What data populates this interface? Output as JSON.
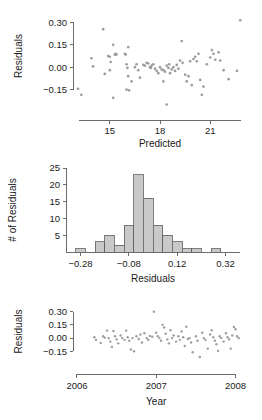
{
  "figure": {
    "title": "",
    "background": "#ffffff",
    "point_color": "#9d9d9d",
    "bar_fill": "#c9c9c9",
    "bar_stroke": "#5f5f5f",
    "axis_color": "#6b6b6b"
  },
  "chart_data": [
    {
      "type": "scatter",
      "panel": "residuals-vs-predicted",
      "title": "",
      "xlabel": "Predicted",
      "ylabel": "Residuals",
      "xlim": [
        12.8,
        23.2
      ],
      "ylim": [
        -0.24,
        0.33
      ],
      "xticks": [
        15,
        18,
        21
      ],
      "xticklabels": [
        "15",
        "18",
        "21"
      ],
      "yticks": [
        -0.15,
        0.0,
        0.15,
        0.3
      ],
      "yticklabels": [
        "-0.15",
        "0.00",
        "0.15",
        "0.30"
      ],
      "grid": false,
      "legend": null,
      "points": [
        {
          "x": 13.1,
          "y": -0.145
        },
        {
          "x": 13.3,
          "y": -0.185
        },
        {
          "x": 13.9,
          "y": 0.06
        },
        {
          "x": 14.0,
          "y": 0.005
        },
        {
          "x": 14.6,
          "y": 0.255
        },
        {
          "x": 14.7,
          "y": -0.045
        },
        {
          "x": 14.9,
          "y": 0.075
        },
        {
          "x": 15.0,
          "y": 0.07
        },
        {
          "x": 15.05,
          "y": 0.035
        },
        {
          "x": 15.2,
          "y": 0.15
        },
        {
          "x": 15.3,
          "y": 0.085
        },
        {
          "x": 15.35,
          "y": 0.09
        },
        {
          "x": 15.4,
          "y": 0.085
        },
        {
          "x": 15.2,
          "y": -0.205
        },
        {
          "x": 15.0,
          "y": -0.02
        },
        {
          "x": 15.9,
          "y": 0.09
        },
        {
          "x": 15.95,
          "y": 0.085
        },
        {
          "x": 16.1,
          "y": 0.135
        },
        {
          "x": 16.0,
          "y": 0.02
        },
        {
          "x": 16.05,
          "y": -0.005
        },
        {
          "x": 16.1,
          "y": -0.06
        },
        {
          "x": 16.0,
          "y": -0.15
        },
        {
          "x": 16.15,
          "y": -0.155
        },
        {
          "x": 16.3,
          "y": -0.095
        },
        {
          "x": 16.5,
          "y": 0.0
        },
        {
          "x": 16.6,
          "y": 0.02
        },
        {
          "x": 16.7,
          "y": -0.02
        },
        {
          "x": 16.8,
          "y": -0.07
        },
        {
          "x": 17.0,
          "y": 0.015
        },
        {
          "x": 17.1,
          "y": 0.01
        },
        {
          "x": 17.2,
          "y": 0.03
        },
        {
          "x": 17.3,
          "y": 0.025
        },
        {
          "x": 17.4,
          "y": 0.0
        },
        {
          "x": 17.45,
          "y": -0.005
        },
        {
          "x": 17.5,
          "y": 0.01
        },
        {
          "x": 17.6,
          "y": 0.02
        },
        {
          "x": 17.7,
          "y": -0.01
        },
        {
          "x": 17.8,
          "y": -0.025
        },
        {
          "x": 17.9,
          "y": -0.04
        },
        {
          "x": 18.0,
          "y": 0.0
        },
        {
          "x": 18.1,
          "y": -0.015
        },
        {
          "x": 18.2,
          "y": -0.02
        },
        {
          "x": 18.3,
          "y": -0.03
        },
        {
          "x": 18.4,
          "y": 0.01
        },
        {
          "x": 18.5,
          "y": -0.005
        },
        {
          "x": 18.55,
          "y": 0.02
        },
        {
          "x": 18.6,
          "y": -0.04
        },
        {
          "x": 18.7,
          "y": -0.015
        },
        {
          "x": 18.8,
          "y": 0.0
        },
        {
          "x": 18.9,
          "y": -0.025
        },
        {
          "x": 18.2,
          "y": -0.095
        },
        {
          "x": 18.4,
          "y": -0.25
        },
        {
          "x": 19.0,
          "y": 0.015
        },
        {
          "x": 19.1,
          "y": -0.01
        },
        {
          "x": 19.2,
          "y": 0.045
        },
        {
          "x": 19.3,
          "y": 0.175
        },
        {
          "x": 19.35,
          "y": 0.03
        },
        {
          "x": 19.5,
          "y": -0.05
        },
        {
          "x": 19.6,
          "y": -0.095
        },
        {
          "x": 19.7,
          "y": -0.06
        },
        {
          "x": 19.8,
          "y": 0.04
        },
        {
          "x": 19.9,
          "y": -0.12
        },
        {
          "x": 20.0,
          "y": 0.055
        },
        {
          "x": 20.1,
          "y": 0.07
        },
        {
          "x": 20.2,
          "y": 0.04
        },
        {
          "x": 20.3,
          "y": 0.09
        },
        {
          "x": 20.4,
          "y": -0.085
        },
        {
          "x": 20.5,
          "y": -0.185
        },
        {
          "x": 20.6,
          "y": -0.13
        },
        {
          "x": 20.8,
          "y": 0.02
        },
        {
          "x": 21.0,
          "y": 0.065
        },
        {
          "x": 21.1,
          "y": 0.115
        },
        {
          "x": 21.2,
          "y": 0.09
        },
        {
          "x": 21.3,
          "y": 0.05
        },
        {
          "x": 21.5,
          "y": 0.1
        },
        {
          "x": 21.6,
          "y": 0.045
        },
        {
          "x": 21.8,
          "y": -0.02
        },
        {
          "x": 22.1,
          "y": -0.08
        },
        {
          "x": 22.6,
          "y": -0.025
        },
        {
          "x": 22.8,
          "y": 0.315
        }
      ]
    },
    {
      "type": "bar",
      "panel": "histogram-of-residuals",
      "title": "",
      "xlabel": "Residuals",
      "ylabel": "# of Residuals",
      "xlim": [
        -0.34,
        0.38
      ],
      "ylim": [
        0,
        25
      ],
      "xticks": [
        -0.28,
        -0.08,
        0.12,
        0.32
      ],
      "xticklabels": [
        "-0.28",
        "-0.08",
        "0.12",
        "0.32"
      ],
      "yticks": [
        5,
        10,
        15,
        20,
        25
      ],
      "yticklabels": [
        "5",
        "10",
        "15",
        "20",
        "25"
      ],
      "grid": false,
      "legend": null,
      "bin_width": 0.04,
      "bins": [
        {
          "left": -0.3,
          "right": -0.26,
          "count": 1
        },
        {
          "left": -0.26,
          "right": -0.22,
          "count": 0
        },
        {
          "left": -0.22,
          "right": -0.18,
          "count": 3
        },
        {
          "left": -0.18,
          "right": -0.14,
          "count": 5
        },
        {
          "left": -0.14,
          "right": -0.1,
          "count": 2
        },
        {
          "left": -0.1,
          "right": -0.06,
          "count": 8
        },
        {
          "left": -0.06,
          "right": -0.02,
          "count": 23
        },
        {
          "left": -0.02,
          "right": 0.02,
          "count": 16
        },
        {
          "left": 0.02,
          "right": 0.06,
          "count": 8
        },
        {
          "left": 0.06,
          "right": 0.1,
          "count": 5
        },
        {
          "left": 0.1,
          "right": 0.14,
          "count": 3
        },
        {
          "left": 0.14,
          "right": 0.18,
          "count": 1
        },
        {
          "left": 0.18,
          "right": 0.22,
          "count": 1
        },
        {
          "left": 0.22,
          "right": 0.26,
          "count": 0
        },
        {
          "left": 0.26,
          "right": 0.3,
          "count": 1
        }
      ]
    },
    {
      "type": "scatter",
      "panel": "residuals-vs-year",
      "title": "",
      "xlabel": "Year",
      "ylabel": "Residuals",
      "xlim": [
        2005.95,
        2008.12
      ],
      "ylim": [
        -0.26,
        0.33
      ],
      "xticks": [
        2006,
        2007,
        2008
      ],
      "xticklabels": [
        "2006",
        "2007",
        "2008"
      ],
      "yticks": [
        -0.15,
        0.0,
        0.15,
        0.3
      ],
      "yticklabels": [
        "-0.15",
        "0.00",
        "0.15",
        "0.30"
      ],
      "grid": false,
      "legend": null,
      "points": [
        {
          "x": 2006.22,
          "y": 0.01
        },
        {
          "x": 2006.24,
          "y": -0.02
        },
        {
          "x": 2006.3,
          "y": -0.055
        },
        {
          "x": 2006.33,
          "y": 0.02
        },
        {
          "x": 2006.35,
          "y": 0.005
        },
        {
          "x": 2006.38,
          "y": 0.085
        },
        {
          "x": 2006.4,
          "y": 0.0
        },
        {
          "x": 2006.42,
          "y": -0.04
        },
        {
          "x": 2006.44,
          "y": -0.1
        },
        {
          "x": 2006.46,
          "y": 0.08
        },
        {
          "x": 2006.48,
          "y": 0.02
        },
        {
          "x": 2006.5,
          "y": -0.015
        },
        {
          "x": 2006.52,
          "y": -0.06
        },
        {
          "x": 2006.55,
          "y": 0.03
        },
        {
          "x": 2006.57,
          "y": 0.0
        },
        {
          "x": 2006.6,
          "y": -0.02
        },
        {
          "x": 2006.62,
          "y": 0.085
        },
        {
          "x": 2006.64,
          "y": 0.01
        },
        {
          "x": 2006.66,
          "y": -0.03
        },
        {
          "x": 2006.68,
          "y": -0.13
        },
        {
          "x": 2006.7,
          "y": 0.0
        },
        {
          "x": 2006.72,
          "y": -0.15
        },
        {
          "x": 2006.75,
          "y": 0.02
        },
        {
          "x": 2006.78,
          "y": -0.01
        },
        {
          "x": 2006.8,
          "y": 0.04
        },
        {
          "x": 2006.82,
          "y": -0.05
        },
        {
          "x": 2006.85,
          "y": 0.055
        },
        {
          "x": 2006.88,
          "y": 0.0
        },
        {
          "x": 2006.9,
          "y": -0.02
        },
        {
          "x": 2006.92,
          "y": 0.025
        },
        {
          "x": 2006.95,
          "y": 0.015
        },
        {
          "x": 2006.97,
          "y": 0.3
        },
        {
          "x": 2007.0,
          "y": 0.06
        },
        {
          "x": 2007.02,
          "y": 0.02
        },
        {
          "x": 2007.04,
          "y": 0.0
        },
        {
          "x": 2007.06,
          "y": -0.03
        },
        {
          "x": 2007.08,
          "y": 0.15
        },
        {
          "x": 2007.1,
          "y": 0.12
        },
        {
          "x": 2007.12,
          "y": 0.05
        },
        {
          "x": 2007.14,
          "y": -0.015
        },
        {
          "x": 2007.16,
          "y": -0.06
        },
        {
          "x": 2007.18,
          "y": 0.09
        },
        {
          "x": 2007.2,
          "y": 0.0
        },
        {
          "x": 2007.22,
          "y": 0.03
        },
        {
          "x": 2007.25,
          "y": -0.04
        },
        {
          "x": 2007.28,
          "y": 0.02
        },
        {
          "x": 2007.3,
          "y": -0.02
        },
        {
          "x": 2007.32,
          "y": 0.075
        },
        {
          "x": 2007.34,
          "y": 0.01
        },
        {
          "x": 2007.36,
          "y": -0.09
        },
        {
          "x": 2007.38,
          "y": 0.13
        },
        {
          "x": 2007.4,
          "y": -0.01
        },
        {
          "x": 2007.42,
          "y": 0.0
        },
        {
          "x": 2007.44,
          "y": -0.05
        },
        {
          "x": 2007.46,
          "y": -0.16
        },
        {
          "x": 2007.5,
          "y": 0.02
        },
        {
          "x": 2007.52,
          "y": -0.03
        },
        {
          "x": 2007.55,
          "y": -0.215
        },
        {
          "x": 2007.58,
          "y": 0.06
        },
        {
          "x": 2007.6,
          "y": 0.0
        },
        {
          "x": 2007.62,
          "y": -0.02
        },
        {
          "x": 2007.65,
          "y": -0.12
        },
        {
          "x": 2007.68,
          "y": 0.04
        },
        {
          "x": 2007.7,
          "y": 0.09
        },
        {
          "x": 2007.72,
          "y": 0.01
        },
        {
          "x": 2007.74,
          "y": -0.03
        },
        {
          "x": 2007.76,
          "y": -0.07
        },
        {
          "x": 2007.78,
          "y": -0.145
        },
        {
          "x": 2007.8,
          "y": 0.02
        },
        {
          "x": 2007.82,
          "y": 0.0
        },
        {
          "x": 2007.85,
          "y": -0.04
        },
        {
          "x": 2007.88,
          "y": 0.055
        },
        {
          "x": 2007.9,
          "y": 0.01
        },
        {
          "x": 2007.92,
          "y": -0.015
        },
        {
          "x": 2007.94,
          "y": -0.12
        },
        {
          "x": 2007.96,
          "y": 0.03
        },
        {
          "x": 2007.98,
          "y": 0.125
        },
        {
          "x": 2008.0,
          "y": 0.1
        },
        {
          "x": 2008.02,
          "y": 0.02
        },
        {
          "x": 2008.04,
          "y": 0.0
        }
      ]
    }
  ]
}
